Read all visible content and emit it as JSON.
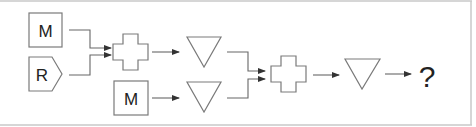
{
  "diagram": {
    "colors": {
      "stroke": "#7a7a7a",
      "text": "#222222",
      "frame": "#c8c8c8",
      "background": "#ffffff"
    },
    "nodes": [
      {
        "id": "m1",
        "shape": "square",
        "label": "M"
      },
      {
        "id": "r1",
        "shape": "pentagon-arrow",
        "label": "R"
      },
      {
        "id": "cross1",
        "shape": "cross",
        "label": ""
      },
      {
        "id": "tri1",
        "shape": "inverted-triangle",
        "label": ""
      },
      {
        "id": "m2",
        "shape": "square",
        "label": "M"
      },
      {
        "id": "tri2",
        "shape": "inverted-triangle",
        "label": ""
      },
      {
        "id": "cross2",
        "shape": "cross",
        "label": ""
      },
      {
        "id": "tri3",
        "shape": "inverted-triangle",
        "label": ""
      },
      {
        "id": "answer",
        "shape": "text",
        "label": "?"
      }
    ],
    "edges": [
      [
        "m1",
        "cross1"
      ],
      [
        "r1",
        "cross1"
      ],
      [
        "cross1",
        "tri1"
      ],
      [
        "m2",
        "tri2"
      ],
      [
        "tri1",
        "cross2"
      ],
      [
        "tri2",
        "cross2"
      ],
      [
        "cross2",
        "tri3"
      ],
      [
        "tri3",
        "answer"
      ]
    ]
  }
}
